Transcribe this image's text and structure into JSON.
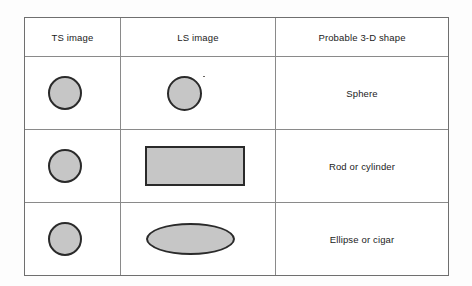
{
  "table": {
    "columns": [
      {
        "key": "ts",
        "label": "TS image"
      },
      {
        "key": "ls",
        "label": "LS image"
      },
      {
        "key": "shape",
        "label": "Probable 3-D shape"
      }
    ],
    "rows": [
      {
        "ts_shape": "circle",
        "ls_shape": "circle",
        "label": "Sphere"
      },
      {
        "ts_shape": "circle",
        "ls_shape": "rectangle",
        "label": "Rod or cylinder"
      },
      {
        "ts_shape": "circle",
        "ls_shape": "ellipse",
        "label": "Ellipse or cigar"
      }
    ]
  },
  "style": {
    "shape_fill": "#c6c6c6",
    "shape_stroke": "#2a2a2a",
    "grid_line": "#8a8a8a",
    "text_color": "#1b1b1b",
    "page_background": "#fdfdfd"
  }
}
